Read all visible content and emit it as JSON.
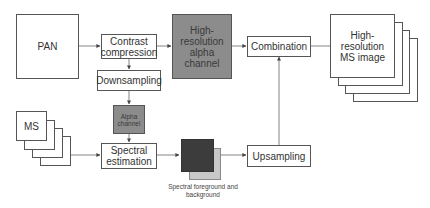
{
  "diagram": {
    "nodes": {
      "pan": {
        "label": "PAN"
      },
      "contrast_compression": {
        "label": "Contrast compression"
      },
      "hr_alpha": {
        "label": "High-resolution alpha channel"
      },
      "combination": {
        "label": "Combination"
      },
      "hr_ms": {
        "label": "High-resolution MS image"
      },
      "downsampling": {
        "label": "Downsampling"
      },
      "alpha": {
        "label": "Alpha channel"
      },
      "ms": {
        "label": "MS"
      },
      "spectral_estimation": {
        "label": "Spectral estimation"
      },
      "upsampling": {
        "label": "Upsampling"
      },
      "spectral_fg_bg": {
        "caption": "Spectral foreground and background"
      }
    },
    "edges": [
      [
        "PAN",
        "Contrast compression"
      ],
      [
        "Contrast compression",
        "High-resolution alpha channel"
      ],
      [
        "Contrast compression",
        "Downsampling"
      ],
      [
        "Downsampling",
        "Alpha channel"
      ],
      [
        "Alpha channel",
        "Spectral estimation"
      ],
      [
        "MS",
        "Spectral estimation"
      ],
      [
        "Spectral estimation",
        "Spectral foreground and background"
      ],
      [
        "Spectral foreground and background",
        "Upsampling"
      ],
      [
        "Upsampling",
        "Combination"
      ],
      [
        "High-resolution alpha channel",
        "Combination"
      ],
      [
        "Combination",
        "High-resolution MS image"
      ]
    ],
    "colors": {
      "alpha_gray": "#8c8c8c",
      "fg_dark": "#3c3c3c",
      "bg_light": "#c8c8c8",
      "line": "#555555"
    }
  }
}
